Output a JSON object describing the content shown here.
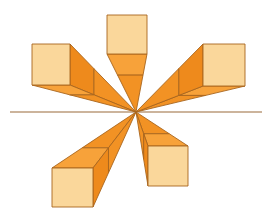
{
  "canvas": {
    "width": 276,
    "height": 220,
    "background": "#ffffff"
  },
  "vanishing_point": {
    "x": 136,
    "y": 112
  },
  "horizon": {
    "x1": 10,
    "x2": 262,
    "y": 112,
    "color": "#9A6A3A"
  },
  "colors": {
    "front": "#FAD79B",
    "side_light": "#F7A23A",
    "side_dark": "#EE8A1C",
    "rays": "#F29224",
    "outline": "#A8651E"
  },
  "depth_ratio": 0.64,
  "cubes": [
    {
      "name": "top",
      "x": 107,
      "y": 15,
      "w": 40,
      "h": 39
    },
    {
      "name": "upper-left",
      "x": 32,
      "y": 44,
      "w": 38,
      "h": 41
    },
    {
      "name": "upper-right",
      "x": 203,
      "y": 44,
      "w": 42,
      "h": 42
    },
    {
      "name": "lower-left",
      "x": 52,
      "y": 168,
      "w": 41,
      "h": 39
    },
    {
      "name": "lower-right",
      "x": 148,
      "y": 146,
      "w": 40,
      "h": 40
    }
  ]
}
